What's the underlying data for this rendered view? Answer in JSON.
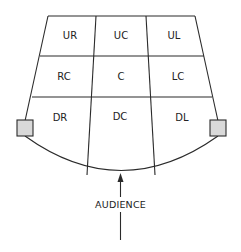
{
  "diagram": {
    "colors": {
      "line": "#2a2a2a",
      "speaker_fill": "#d9d9d9",
      "background": "#ffffff"
    },
    "areas": {
      "row_up": [
        "UR",
        "UC",
        "UL"
      ],
      "row_center": [
        "RC",
        "C",
        "LC"
      ],
      "row_down": [
        "DR",
        "DC",
        "DL"
      ]
    },
    "audience_label": "AUDIENCE",
    "side_boxes": [
      "left-speaker",
      "right-speaker"
    ]
  }
}
